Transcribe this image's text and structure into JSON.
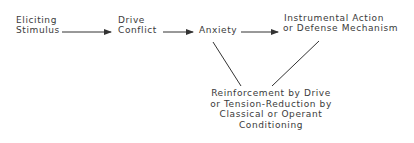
{
  "diagram": {
    "nodes": {
      "eliciting_stimulus": {
        "line1": "Eliciting",
        "line2": "Stimulus"
      },
      "drive_conflict": {
        "line1": "Drive",
        "line2": "Conflict"
      },
      "anxiety": {
        "line1": "Anxiety"
      },
      "instrumental_action": {
        "line1": "Instrumental Action",
        "line2": "or Defense Mechanism"
      },
      "reinforcement": {
        "line1": "Reinforcement by Drive",
        "line2": "or Tension-Reduction by",
        "line3": "Classical or Operant",
        "line4": "Conditioning"
      }
    },
    "edges": [
      {
        "from": "Eliciting Stimulus",
        "to": "Drive Conflict",
        "type": "arrow"
      },
      {
        "from": "Drive Conflict",
        "to": "Anxiety",
        "type": "arrow"
      },
      {
        "from": "Anxiety",
        "to": "Instrumental Action or Defense Mechanism",
        "type": "arrow"
      },
      {
        "from": "Anxiety",
        "to": "Reinforcement",
        "type": "line"
      },
      {
        "from": "Instrumental Action or Defense Mechanism",
        "to": "Reinforcement",
        "type": "line"
      }
    ],
    "colors": {
      "text": "#3a3a3a",
      "line": "#333333",
      "background": "#ffffff"
    }
  }
}
